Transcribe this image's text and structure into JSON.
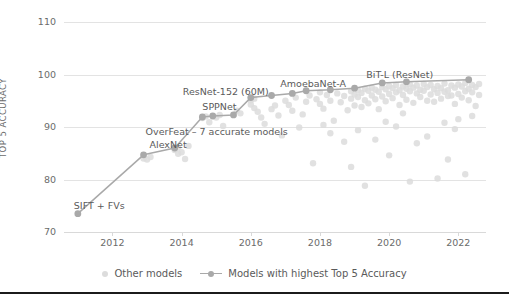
{
  "chart_data": {
    "type": "scatter",
    "title": "",
    "xlabel": "",
    "ylabel": "TOP 5 ACCURACY",
    "xlim": [
      2010.6,
      2022.8
    ],
    "ylim": [
      70,
      110
    ],
    "xticks": [
      2012,
      2014,
      2016,
      2018,
      2020,
      2022
    ],
    "xtick_labels": [
      "2012",
      "2014",
      "2016",
      "2018",
      "2020",
      "2022"
    ],
    "yticks": [
      70,
      80,
      90,
      100,
      110
    ],
    "ytick_labels": [
      "70",
      "80",
      "90",
      "100",
      "110"
    ],
    "grid": "horizontal",
    "legend_position": "bottom",
    "series": [
      {
        "name": "Other models",
        "type": "scatter",
        "color": "#dcdcdc",
        "points": [
          [
            2012.9,
            84.0
          ],
          [
            2013.0,
            83.8
          ],
          [
            2013.1,
            84.3
          ],
          [
            2013.8,
            85.6
          ],
          [
            2013.9,
            84.9
          ],
          [
            2013.9,
            86.1
          ],
          [
            2014.0,
            85.2
          ],
          [
            2014.1,
            83.9
          ],
          [
            2014.2,
            86.4
          ],
          [
            2014.6,
            91.7
          ],
          [
            2014.7,
            92.0
          ],
          [
            2014.8,
            90.9
          ],
          [
            2015.0,
            91.8
          ],
          [
            2015.1,
            92.3
          ],
          [
            2015.2,
            90.2
          ],
          [
            2015.6,
            93.1
          ],
          [
            2015.7,
            92.6
          ],
          [
            2016.0,
            95.1
          ],
          [
            2016.0,
            94.3
          ],
          [
            2016.1,
            93.6
          ],
          [
            2016.1,
            95.4
          ],
          [
            2016.2,
            92.9
          ],
          [
            2016.3,
            91.8
          ],
          [
            2016.4,
            90.6
          ],
          [
            2016.6,
            93.4
          ],
          [
            2016.7,
            94.1
          ],
          [
            2016.8,
            92.2
          ],
          [
            2017.0,
            95.0
          ],
          [
            2017.1,
            94.2
          ],
          [
            2017.2,
            93.1
          ],
          [
            2017.3,
            95.6
          ],
          [
            2017.5,
            92.4
          ],
          [
            2017.6,
            94.8
          ],
          [
            2017.7,
            96.0
          ],
          [
            2017.9,
            95.3
          ],
          [
            2018.0,
            96.6
          ],
          [
            2018.0,
            94.4
          ],
          [
            2018.1,
            93.5
          ],
          [
            2018.2,
            96.1
          ],
          [
            2018.3,
            95.0
          ],
          [
            2018.4,
            91.2
          ],
          [
            2018.5,
            96.4
          ],
          [
            2018.6,
            94.7
          ],
          [
            2018.7,
            95.9
          ],
          [
            2018.8,
            93.2
          ],
          [
            2018.9,
            96.8
          ],
          [
            2018.9,
            95.4
          ],
          [
            2019.0,
            94.1
          ],
          [
            2019.0,
            96.2
          ],
          [
            2019.1,
            97.0
          ],
          [
            2019.1,
            95.7
          ],
          [
            2019.2,
            93.8
          ],
          [
            2019.2,
            96.5
          ],
          [
            2019.3,
            97.3
          ],
          [
            2019.3,
            95.1
          ],
          [
            2019.4,
            96.9
          ],
          [
            2019.4,
            94.5
          ],
          [
            2019.5,
            97.5
          ],
          [
            2019.5,
            96.0
          ],
          [
            2019.6,
            95.3
          ],
          [
            2019.6,
            97.1
          ],
          [
            2019.7,
            93.4
          ],
          [
            2019.7,
            96.7
          ],
          [
            2019.8,
            97.6
          ],
          [
            2019.8,
            95.8
          ],
          [
            2019.9,
            94.9
          ],
          [
            2019.9,
            97.2
          ],
          [
            2020.0,
            96.3
          ],
          [
            2020.0,
            97.8
          ],
          [
            2020.1,
            95.5
          ],
          [
            2020.1,
            97.4
          ],
          [
            2020.2,
            96.6
          ],
          [
            2020.2,
            98.0
          ],
          [
            2020.3,
            94.2
          ],
          [
            2020.3,
            97.0
          ],
          [
            2020.4,
            96.1
          ],
          [
            2020.4,
            97.7
          ],
          [
            2020.5,
            95.2
          ],
          [
            2020.5,
            97.3
          ],
          [
            2020.6,
            96.8
          ],
          [
            2020.6,
            98.1
          ],
          [
            2020.7,
            94.6
          ],
          [
            2020.7,
            97.5
          ],
          [
            2020.8,
            96.4
          ],
          [
            2020.8,
            97.9
          ],
          [
            2020.9,
            95.7
          ],
          [
            2020.9,
            97.1
          ],
          [
            2021.0,
            96.9
          ],
          [
            2021.0,
            98.2
          ],
          [
            2021.1,
            95.0
          ],
          [
            2021.1,
            97.6
          ],
          [
            2021.2,
            96.2
          ],
          [
            2021.2,
            98.0
          ],
          [
            2021.3,
            94.8
          ],
          [
            2021.3,
            97.2
          ],
          [
            2021.4,
            96.5
          ],
          [
            2021.4,
            97.8
          ],
          [
            2021.5,
            95.4
          ],
          [
            2021.5,
            97.4
          ],
          [
            2021.6,
            96.7
          ],
          [
            2021.6,
            98.3
          ],
          [
            2021.7,
            95.9
          ],
          [
            2021.7,
            97.0
          ],
          [
            2021.8,
            96.0
          ],
          [
            2021.8,
            97.9
          ],
          [
            2021.9,
            94.4
          ],
          [
            2021.9,
            97.5
          ],
          [
            2022.0,
            96.3
          ],
          [
            2022.0,
            98.1
          ],
          [
            2022.1,
            95.6
          ],
          [
            2022.1,
            97.7
          ],
          [
            2022.2,
            96.8
          ],
          [
            2022.2,
            98.4
          ],
          [
            2022.3,
            95.1
          ],
          [
            2022.3,
            97.3
          ],
          [
            2022.4,
            96.6
          ],
          [
            2022.4,
            98.0
          ],
          [
            2022.5,
            94.0
          ],
          [
            2022.5,
            97.6
          ],
          [
            2022.6,
            96.1
          ],
          [
            2022.6,
            98.2
          ],
          [
            2018.3,
            88.8
          ],
          [
            2019.1,
            89.4
          ],
          [
            2020.2,
            90.1
          ],
          [
            2021.1,
            88.2
          ],
          [
            2022.0,
            91.5
          ],
          [
            2019.6,
            87.6
          ],
          [
            2020.8,
            86.9
          ],
          [
            2021.6,
            90.8
          ],
          [
            2017.4,
            89.9
          ],
          [
            2018.7,
            87.2
          ],
          [
            2022.4,
            92.1
          ],
          [
            2019.9,
            91.0
          ],
          [
            2016.9,
            88.4
          ],
          [
            2021.9,
            89.6
          ],
          [
            2020.4,
            92.6
          ],
          [
            2018.1,
            90.4
          ],
          [
            2019.3,
            78.8
          ],
          [
            2020.6,
            79.6
          ],
          [
            2021.4,
            80.2
          ],
          [
            2022.2,
            81.0
          ],
          [
            2017.8,
            83.1
          ],
          [
            2018.9,
            82.4
          ],
          [
            2020.0,
            84.6
          ],
          [
            2021.7,
            83.8
          ]
        ]
      },
      {
        "name": "Models with highest Top 5 Accuracy",
        "type": "line",
        "color": "#a9a9a9",
        "points": [
          [
            2011.0,
            73.5
          ],
          [
            2012.9,
            84.7
          ],
          [
            2013.8,
            86.0
          ],
          [
            2014.6,
            91.9
          ],
          [
            2014.9,
            92.1
          ],
          [
            2015.5,
            92.3
          ],
          [
            2016.0,
            95.6
          ],
          [
            2016.6,
            96.0
          ],
          [
            2017.2,
            96.4
          ],
          [
            2017.6,
            96.9
          ],
          [
            2018.3,
            97.1
          ],
          [
            2019.0,
            97.4
          ],
          [
            2019.8,
            98.4
          ],
          [
            2020.5,
            98.6
          ],
          [
            2022.3,
            99.0
          ]
        ]
      }
    ],
    "annotations": [
      {
        "text": "SIFT + FVs",
        "x": 2011.0,
        "y": 73.5,
        "dx": -4,
        "dy": -14
      },
      {
        "text": "AlexNet",
        "x": 2012.9,
        "y": 84.7,
        "dx": 6,
        "dy": -16
      },
      {
        "text": "OverFeat – 7 accurate models",
        "x": 2012.9,
        "y": 84.7,
        "dx": 2,
        "dy": -29
      },
      {
        "text": "SPPNet",
        "x": 2014.6,
        "y": 91.9,
        "dx": 0,
        "dy": -16
      },
      {
        "text": "ResNet-152 (60M)",
        "x": 2016.0,
        "y": 95.6,
        "dx": -68,
        "dy": -12
      },
      {
        "text": "AmoebaNet-A",
        "x": 2018.3,
        "y": 97.1,
        "dx": -50,
        "dy": -12
      },
      {
        "text": "BiT-L (ResNet)",
        "x": 2019.8,
        "y": 98.4,
        "dx": -16,
        "dy": -14
      }
    ]
  },
  "legend": {
    "items": [
      {
        "label": "Other models",
        "marker": "dot",
        "color": "#dcdcdc"
      },
      {
        "label": "Models with highest Top 5 Accuracy",
        "marker": "line-dot",
        "color": "#a9a9a9"
      }
    ]
  }
}
